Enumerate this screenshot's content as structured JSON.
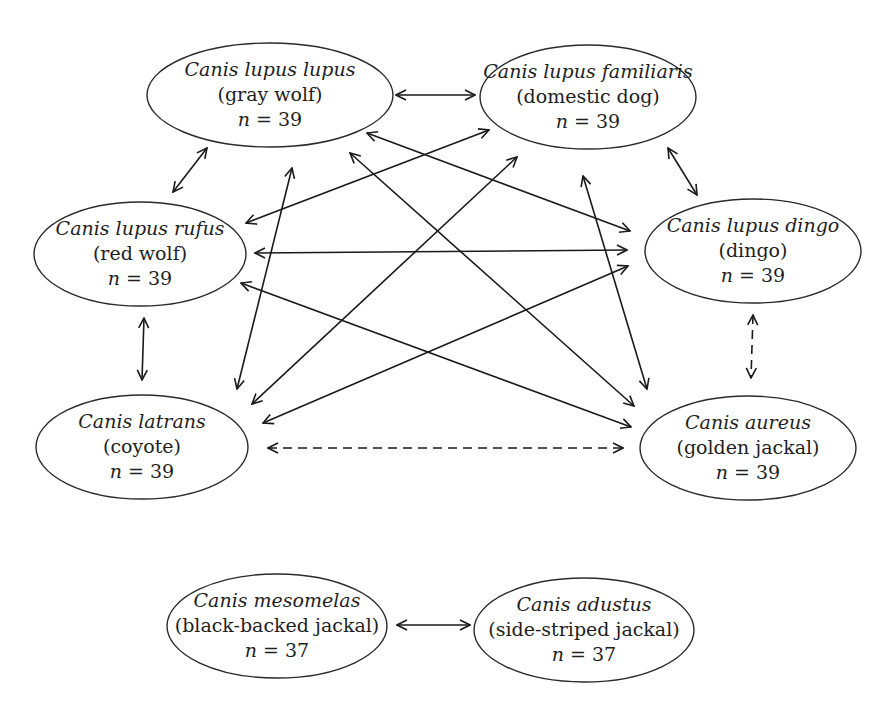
{
  "diagram": {
    "type": "relationship-graph",
    "nodes": [
      {
        "id": "lupus",
        "scientific": "Canis lupus lupus",
        "common": "(gray wolf)",
        "n_label": "n",
        "n_value": "= 39",
        "cx": 270,
        "cy": 95,
        "rx": 123,
        "ry": 52
      },
      {
        "id": "familiaris",
        "scientific": "Canis lupus familiaris",
        "common": "(domestic dog)",
        "n_label": "n",
        "n_value": "= 39",
        "cx": 588,
        "cy": 97,
        "rx": 108,
        "ry": 52
      },
      {
        "id": "rufus",
        "scientific": "Canis lupus rufus",
        "common": "(red wolf)",
        "n_label": "n",
        "n_value": "= 39",
        "cx": 140,
        "cy": 254,
        "rx": 106,
        "ry": 52
      },
      {
        "id": "dingo",
        "scientific": "Canis lupus dingo",
        "common": "(dingo)",
        "n_label": "n",
        "n_value": "= 39",
        "cx": 753,
        "cy": 251,
        "rx": 108,
        "ry": 52
      },
      {
        "id": "latrans",
        "scientific": "Canis latrans",
        "common": "(coyote)",
        "n_label": "n",
        "n_value": "= 39",
        "cx": 142,
        "cy": 447,
        "rx": 106,
        "ry": 52
      },
      {
        "id": "aureus",
        "scientific": "Canis aureus",
        "common": "(golden jackal)",
        "n_label": "n",
        "n_value": "= 39",
        "cx": 748,
        "cy": 448,
        "rx": 108,
        "ry": 52
      },
      {
        "id": "mesomelas",
        "scientific": "Canis mesomelas",
        "common": "(black-backed jackal)",
        "n_label": "n",
        "n_value": "= 37",
        "cx": 277,
        "cy": 626,
        "rx": 110,
        "ry": 52
      },
      {
        "id": "adustus",
        "scientific": "Canis adustus",
        "common": "(side-striped jackal)",
        "n_label": "n",
        "n_value": "= 37",
        "cx": 584,
        "cy": 630,
        "rx": 110,
        "ry": 52
      }
    ],
    "edges": [
      {
        "from": "lupus",
        "to": "familiaris",
        "style": "solid",
        "x1": 396,
        "y1": 95,
        "x2": 475,
        "y2": 95
      },
      {
        "from": "lupus",
        "to": "rufus",
        "style": "solid",
        "x1": 207,
        "y1": 148,
        "x2": 173,
        "y2": 192
      },
      {
        "from": "familiaris",
        "to": "dingo",
        "style": "solid",
        "x1": 668,
        "y1": 148,
        "x2": 697,
        "y2": 195
      },
      {
        "from": "rufus",
        "to": "latrans",
        "style": "solid",
        "x1": 144,
        "y1": 318,
        "x2": 142,
        "y2": 380
      },
      {
        "from": "dingo",
        "to": "aureus",
        "style": "dashed",
        "x1": 753,
        "y1": 315,
        "x2": 751,
        "y2": 378
      },
      {
        "from": "latrans",
        "to": "aureus",
        "style": "dashed",
        "x1": 268,
        "y1": 448,
        "x2": 623,
        "y2": 448
      },
      {
        "from": "mesomelas",
        "to": "adustus",
        "style": "solid",
        "x1": 397,
        "y1": 625,
        "x2": 470,
        "y2": 625
      },
      {
        "from": "lupus",
        "to": "dingo",
        "style": "solid",
        "x1": 367,
        "y1": 133,
        "x2": 630,
        "y2": 231
      },
      {
        "from": "lupus",
        "to": "aureus",
        "style": "solid",
        "x1": 350,
        "y1": 153,
        "x2": 634,
        "y2": 406
      },
      {
        "from": "lupus",
        "to": "latrans",
        "style": "solid",
        "x1": 292,
        "y1": 168,
        "x2": 237,
        "y2": 389
      },
      {
        "from": "familiaris",
        "to": "rufus",
        "style": "solid",
        "x1": 489,
        "y1": 130,
        "x2": 246,
        "y2": 223
      },
      {
        "from": "familiaris",
        "to": "latrans",
        "style": "solid",
        "x1": 517,
        "y1": 157,
        "x2": 252,
        "y2": 404
      },
      {
        "from": "familiaris",
        "to": "aureus",
        "style": "solid",
        "x1": 583,
        "y1": 176,
        "x2": 647,
        "y2": 389
      },
      {
        "from": "rufus",
        "to": "dingo",
        "style": "solid",
        "x1": 255,
        "y1": 253,
        "x2": 627,
        "y2": 250
      },
      {
        "from": "rufus",
        "to": "aureus",
        "style": "solid",
        "x1": 241,
        "y1": 283,
        "x2": 631,
        "y2": 427
      },
      {
        "from": "dingo",
        "to": "latrans",
        "style": "solid",
        "x1": 628,
        "y1": 266,
        "x2": 263,
        "y2": 423
      }
    ]
  }
}
